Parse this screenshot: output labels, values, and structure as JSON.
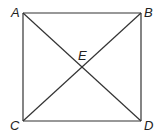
{
  "diagram": {
    "type": "square-with-diagonals",
    "colors": {
      "stroke": "#333333",
      "label": "#222222",
      "background": "#ffffff"
    },
    "points": {
      "A": {
        "x": 23,
        "y": 13
      },
      "B": {
        "x": 141,
        "y": 13
      },
      "C": {
        "x": 23,
        "y": 121
      },
      "D": {
        "x": 141,
        "y": 121
      },
      "E": {
        "x": 82,
        "y": 67
      }
    },
    "labels": {
      "A": "A",
      "B": "B",
      "C": "C",
      "D": "D",
      "E": "E"
    },
    "segments": [
      [
        "A",
        "B"
      ],
      [
        "B",
        "D"
      ],
      [
        "D",
        "C"
      ],
      [
        "C",
        "A"
      ],
      [
        "A",
        "D"
      ],
      [
        "B",
        "C"
      ]
    ]
  }
}
